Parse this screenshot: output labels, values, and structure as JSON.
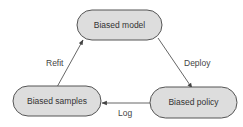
{
  "diagram": {
    "type": "cycle",
    "nodes": [
      {
        "id": "model",
        "label": "Biased model",
        "x": 77,
        "y": 10,
        "w": 85,
        "h": 30
      },
      {
        "id": "policy",
        "label": "Biased policy",
        "x": 150,
        "y": 87,
        "w": 87,
        "h": 31
      },
      {
        "id": "samples",
        "label": "Biased samples",
        "x": 13,
        "y": 86,
        "w": 88,
        "h": 30
      }
    ],
    "edges": [
      {
        "from": "model",
        "to": "policy",
        "label": "Deploy"
      },
      {
        "from": "policy",
        "to": "samples",
        "label": "Log"
      },
      {
        "from": "samples",
        "to": "model",
        "label": "Refit"
      }
    ],
    "colors": {
      "node_fill": "#dddddd",
      "node_stroke": "#555555",
      "edge": "#555555",
      "text": "#333333"
    }
  }
}
